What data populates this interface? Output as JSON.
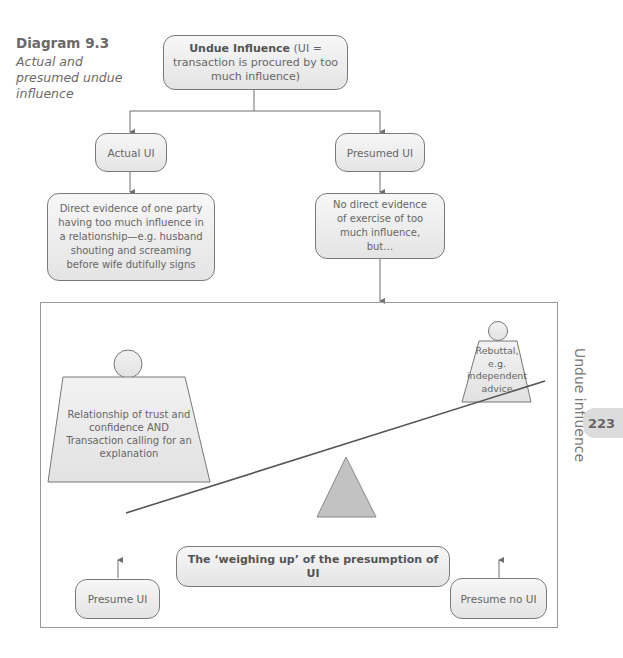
{
  "caption": {
    "number": "Diagram 9.3",
    "subtitle": "Actual and presumed undue influence"
  },
  "nodes": {
    "root": {
      "bold": "Undue Influence",
      "text": " (UI = transaction is procured by too much influence)"
    },
    "actual": {
      "text": "Actual UI"
    },
    "presumed": {
      "text": "Presumed UI"
    },
    "actual_detail": {
      "text": "Direct evidence of one party having too much influence in a relationship—e.g. husband shouting and screaming before wife dutifully signs"
    },
    "presumed_detail": {
      "text": "No direct evidence of exercise of too much influence, but…"
    }
  },
  "scale": {
    "left_weight": "Relationship of trust and confidence AND Transaction calling for an explanation",
    "right_weight": "Rebuttal, e.g. independent advice",
    "title": "The ‘weighing up’ of the presumption of UI",
    "left_outcome": "Presume UI",
    "right_outcome": "Presume no UI"
  },
  "page": {
    "side_label": "Undue influence",
    "number": "223"
  },
  "colors": {
    "line": "#6f6f6f",
    "box_fill_top": "#f7f7f7",
    "box_fill_bottom": "#e4e4e4",
    "fulcrum": "#c2c2c2",
    "weight_fill": "#e6e6e6"
  }
}
